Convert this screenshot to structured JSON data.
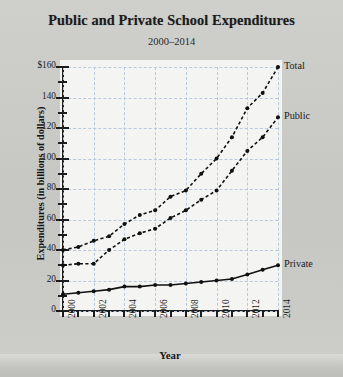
{
  "chart_data": {
    "type": "line",
    "title": "Public and Private School Expenditures",
    "subtitle": "2000–2014",
    "xlabel": "Year",
    "ylabel": "Expenditures (in billions of dollars)",
    "xlim": [
      2000,
      2014
    ],
    "ylim": [
      0,
      160
    ],
    "grid": true,
    "legend_position": "right-of-endpoints",
    "x": [
      2000,
      2001,
      2002,
      2003,
      2004,
      2005,
      2006,
      2007,
      2008,
      2009,
      2010,
      2011,
      2012,
      2013,
      2014
    ],
    "x_tick_labels": [
      "2000",
      "2002",
      "2004",
      "2006",
      "2008",
      "2010",
      "2012",
      "2014"
    ],
    "y_tick_labels": [
      "$160",
      "140",
      "120",
      "100",
      "80",
      "60",
      "40",
      "20",
      "0"
    ],
    "y_major_step": 20,
    "y_minor_step": 10,
    "series": [
      {
        "name": "Total",
        "values": [
          40,
          42,
          46,
          49,
          57,
          63,
          66,
          75,
          79,
          90,
          100,
          114,
          133,
          143,
          160
        ]
      },
      {
        "name": "Public",
        "values": [
          30,
          31,
          31,
          40,
          47,
          51,
          54,
          61,
          66,
          73,
          79,
          92,
          105,
          114,
          127
        ]
      },
      {
        "name": "Private",
        "values": [
          11,
          12,
          13,
          14,
          16,
          16,
          17,
          17,
          18,
          19,
          20,
          21,
          24,
          27,
          30
        ]
      }
    ]
  },
  "legend": {
    "total": "Total",
    "public": "Public",
    "private": "Private"
  }
}
